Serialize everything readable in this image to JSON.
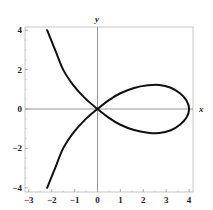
{
  "chart_data": {
    "type": "line",
    "title": "",
    "xlabel": "x",
    "ylabel": "y",
    "xlim": [
      -3.2,
      4.2
    ],
    "ylim": [
      -4.1,
      4.1
    ],
    "grid": false,
    "legend": null,
    "x_ticks": [
      -3,
      -2,
      -1,
      0,
      1,
      2,
      3,
      4
    ],
    "y_ticks": [
      -4,
      -2,
      0,
      2,
      4
    ],
    "x_tick_labels": [
      "−3",
      "−2",
      "−1",
      "0",
      "1",
      "2",
      "3",
      "4"
    ],
    "y_tick_labels": [
      "−4",
      "−2",
      "0",
      "2",
      "4"
    ],
    "series": [
      {
        "name": "curve",
        "color": "#111111",
        "description": "Symmetric loop curve (nodal cubic-like) with a double point at origin; loop extends to x=4, branches go to upper/lower left.",
        "points": [
          [
            -2.2,
            4.0
          ],
          [
            -1.85,
            3.0
          ],
          [
            -1.5,
            2.0
          ],
          [
            -1.05,
            1.2
          ],
          [
            -0.55,
            0.55
          ],
          [
            0.0,
            0.0
          ],
          [
            0.5,
            -0.45
          ],
          [
            1.0,
            -0.8
          ],
          [
            1.6,
            -1.07
          ],
          [
            2.2,
            -1.2
          ],
          [
            2.7,
            -1.22
          ],
          [
            3.2,
            -1.08
          ],
          [
            3.6,
            -0.8
          ],
          [
            3.88,
            -0.45
          ],
          [
            4.0,
            0.0
          ],
          [
            3.88,
            0.45
          ],
          [
            3.6,
            0.8
          ],
          [
            3.2,
            1.08
          ],
          [
            2.7,
            1.22
          ],
          [
            2.2,
            1.2
          ],
          [
            1.6,
            1.07
          ],
          [
            1.0,
            0.8
          ],
          [
            0.5,
            0.45
          ],
          [
            0.0,
            0.0
          ],
          [
            -0.55,
            -0.55
          ],
          [
            -1.05,
            -1.2
          ],
          [
            -1.5,
            -2.0
          ],
          [
            -1.85,
            -3.0
          ],
          [
            -2.2,
            -4.0
          ]
        ]
      }
    ]
  },
  "labels": {
    "x_axis": "x",
    "y_axis": "y"
  }
}
